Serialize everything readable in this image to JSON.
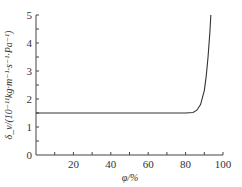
{
  "chart_data": {
    "type": "line",
    "title": "",
    "xlabel": "φ/%",
    "ylabel": "δ_v/(10⁻¹¹kg·m⁻¹·s⁻¹·Pa⁻¹)",
    "xlim": [
      0,
      100
    ],
    "ylim": [
      0,
      5
    ],
    "xticks": [
      "20",
      "40",
      "60",
      "80",
      "100"
    ],
    "yticks": [
      "0",
      "1",
      "2",
      "3",
      "4",
      "5"
    ],
    "grid": false,
    "series": [
      {
        "name": "δv",
        "x": [
          0,
          20,
          40,
          60,
          80,
          84,
          86,
          88,
          90,
          91,
          92,
          93,
          93.5
        ],
        "values": [
          1.5,
          1.5,
          1.5,
          1.5,
          1.5,
          1.52,
          1.6,
          1.8,
          2.3,
          2.8,
          3.5,
          4.4,
          5.0
        ]
      }
    ]
  }
}
